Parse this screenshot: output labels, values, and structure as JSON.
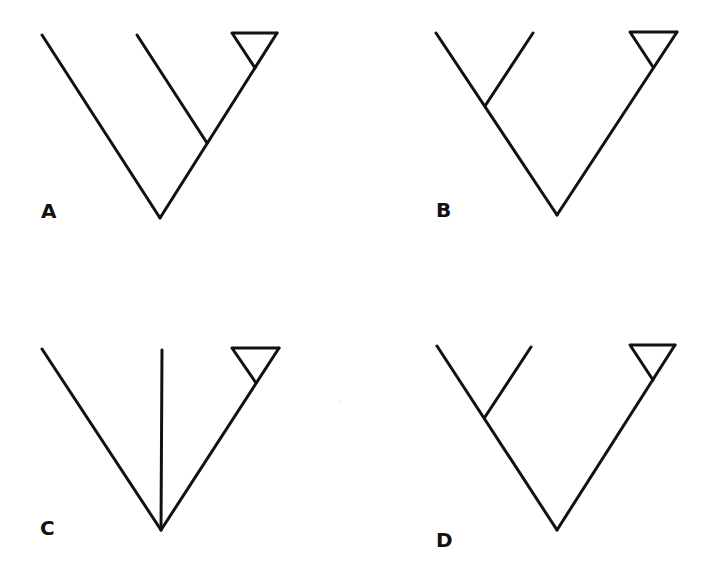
{
  "figure": {
    "type": "cladograms",
    "panels": [
      {
        "id": "A",
        "label": "A",
        "topology": "(X,(Y,(Z-clade)))",
        "description": "Basal lineage diverges first; middle lineage is sister to collapsed terminal clade (triangle)."
      },
      {
        "id": "B",
        "label": "B",
        "topology": "((X,Y),(Z-clade))",
        "description": "Two lineages form a clade on the left branch; collapsed clade (triangle) on the right branch."
      },
      {
        "id": "C",
        "label": "C",
        "topology": "(X,Y,(Z-clade))",
        "description": "Unresolved trichotomy: three lineages arise from one node, one leading to collapsed clade (triangle)."
      },
      {
        "id": "D",
        "label": "D",
        "topology": "((X,Y),(Z-clade))",
        "description": "Two lineages form a clade on the left branch; collapsed clade (triangle) on the right branch."
      }
    ],
    "line_color": "#111111",
    "background": "#ffffff"
  }
}
